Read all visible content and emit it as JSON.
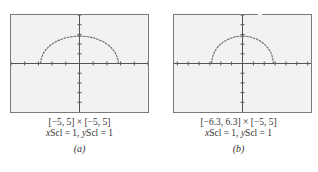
{
  "figure": {
    "panels": [
      {
        "id": "a",
        "label": "(a)",
        "window_text": "[−5, 5] × [−5, 5]",
        "scale_x_var": "x",
        "scale_x_rest": "Scl = 1, ",
        "scale_y_var": "y",
        "scale_y_rest": "Scl = 1",
        "xmin": -5,
        "xmax": 5,
        "ymin": -5,
        "ymax": 5,
        "xscl": 1,
        "yscl": 1
      },
      {
        "id": "b",
        "label": "(b)",
        "window_text": "[−6.3, 6.3] × [−5, 5]",
        "scale_x_var": "x",
        "scale_x_rest": "Scl = 1, ",
        "scale_y_var": "y",
        "scale_y_rest": "Scl = 1",
        "xmin": -6.3,
        "xmax": 6.3,
        "ymin": -5,
        "ymax": 5,
        "xscl": 1,
        "yscl": 1
      }
    ],
    "curve": "upper semicircle centered at origin, radius ≈ 2.8",
    "colors": {
      "frame": "#7a7a7a",
      "screen": "#f2f2f2",
      "axis": "#555555",
      "curve": "#666666",
      "text": "#333333"
    }
  }
}
